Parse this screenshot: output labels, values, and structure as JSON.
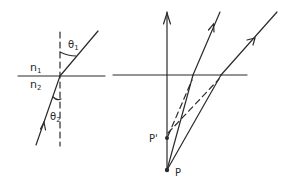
{
  "diagram": {
    "left": {
      "title": "refraction-at-interface",
      "labels": {
        "n1": "n",
        "n1_sub": "1",
        "n2": "n",
        "n2_sub": "2",
        "theta1": "θ",
        "theta1_sub": "1",
        "theta2": "θ",
        "theta2_sub": "2"
      }
    },
    "right": {
      "title": "apparent-depth",
      "labels": {
        "p": "P",
        "p_prime": "P'"
      }
    },
    "colors": {
      "ink": "#2a2a2a",
      "background": "#ffffff"
    }
  }
}
